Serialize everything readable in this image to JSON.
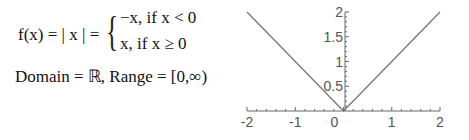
{
  "formula": {
    "lhs": "f(x) = | x | =",
    "case1": "−x,  if  x < 0",
    "case2": "x,   if  x ≥ 0",
    "domain_range": "Domain = ℝ, Range = [0,∞)"
  },
  "chart_data": {
    "type": "line",
    "title": "",
    "xlabel": "",
    "ylabel": "",
    "xlim": [
      -2,
      2
    ],
    "ylim": [
      0,
      2
    ],
    "x_ticks": [
      "-2",
      "-1",
      "0",
      "1",
      "2"
    ],
    "y_ticks": [
      "0.5",
      "1",
      "1.5",
      "2"
    ],
    "grid": false,
    "series": [
      {
        "name": "f(x) = |x|",
        "x": [
          -2,
          -1,
          0,
          1,
          2
        ],
        "values": [
          2,
          1,
          0,
          1,
          2
        ],
        "color": "#777777"
      }
    ]
  }
}
